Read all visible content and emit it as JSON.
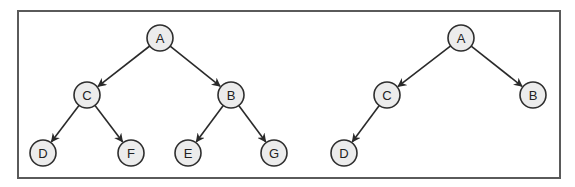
{
  "diagram": {
    "type": "binary-trees",
    "frame": {
      "x": 18,
      "y": 11,
      "width": 542,
      "height": 167
    },
    "trees": [
      {
        "name": "left-tree",
        "nodes": [
          {
            "id": "A",
            "label": "A",
            "x": 160,
            "y": 38
          },
          {
            "id": "C",
            "label": "C",
            "x": 87,
            "y": 95
          },
          {
            "id": "B",
            "label": "B",
            "x": 231,
            "y": 95
          },
          {
            "id": "D",
            "label": "D",
            "x": 43,
            "y": 153
          },
          {
            "id": "F",
            "label": "F",
            "x": 131,
            "y": 153
          },
          {
            "id": "E",
            "label": "E",
            "x": 188,
            "y": 153
          },
          {
            "id": "G",
            "label": "G",
            "x": 274,
            "y": 153
          }
        ],
        "edges": [
          {
            "from": "A",
            "to": "C"
          },
          {
            "from": "A",
            "to": "B"
          },
          {
            "from": "C",
            "to": "D"
          },
          {
            "from": "C",
            "to": "F"
          },
          {
            "from": "B",
            "to": "E"
          },
          {
            "from": "B",
            "to": "G"
          }
        ]
      },
      {
        "name": "right-tree",
        "nodes": [
          {
            "id": "A",
            "label": "A",
            "x": 461,
            "y": 38
          },
          {
            "id": "C",
            "label": "C",
            "x": 387,
            "y": 95
          },
          {
            "id": "B",
            "label": "B",
            "x": 533,
            "y": 95
          },
          {
            "id": "D",
            "label": "D",
            "x": 344,
            "y": 153
          }
        ],
        "edges": [
          {
            "from": "A",
            "to": "C"
          },
          {
            "from": "A",
            "to": "B"
          },
          {
            "from": "C",
            "to": "D"
          }
        ]
      }
    ],
    "style": {
      "node_radius": 13,
      "node_fill": "#ececec",
      "node_stroke": "#2e2e2e",
      "edge_color": "#2a2a2a",
      "frame_color": "#5a5a5a"
    }
  }
}
